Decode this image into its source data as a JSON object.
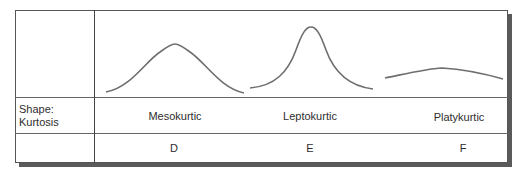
{
  "row_header": {
    "line1": "Shape:",
    "line2": "Kurtosis"
  },
  "columns": [
    {
      "shape_name": "Mesokurtic",
      "letter": "D",
      "curve": "normal-bell-curve"
    },
    {
      "shape_name": "Leptokurtic",
      "letter": "E",
      "curve": "tall-narrow-peak-curve"
    },
    {
      "shape_name": "Platykurtic",
      "letter": "F",
      "curve": "flat-wide-curve"
    }
  ],
  "colors": {
    "curve_stroke": "#6e6e6e",
    "grid_line": "#555555",
    "shadow": "#5a5a5a"
  }
}
